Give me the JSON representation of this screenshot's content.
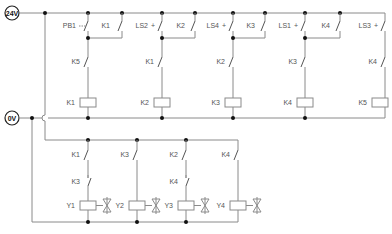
{
  "terminals": {
    "supply": {
      "label": "24V",
      "x": 12,
      "y": 13
    },
    "ground": {
      "label": "0V",
      "x": 12,
      "y": 118
    }
  },
  "colors": {
    "wire": "#8a8a8a",
    "node": "#111111",
    "text": "#555555"
  },
  "control_rungs": [
    {
      "id": "rung1",
      "input": {
        "label": "PB1",
        "type": "pushbutton-no"
      },
      "holding": {
        "label": "K1"
      },
      "interlock": {
        "label": "K5",
        "type": "no"
      },
      "coil": {
        "label": "K1"
      }
    },
    {
      "id": "rung2",
      "input": {
        "label": "LS2",
        "type": "limit-switch-no"
      },
      "holding": {
        "label": "K2"
      },
      "interlock": {
        "label": "K1",
        "type": "no"
      },
      "coil": {
        "label": "K2"
      }
    },
    {
      "id": "rung3",
      "input": {
        "label": "LS4",
        "type": "limit-switch-no"
      },
      "holding": {
        "label": "K3"
      },
      "interlock": {
        "label": "K2",
        "type": "no"
      },
      "coil": {
        "label": "K3"
      }
    },
    {
      "id": "rung4",
      "input": {
        "label": "LS1",
        "type": "limit-switch-no"
      },
      "holding": {
        "label": "K4"
      },
      "interlock": {
        "label": "K3",
        "type": "no"
      },
      "coil": {
        "label": "K4"
      }
    },
    {
      "id": "rung5",
      "input": {
        "label": "LS3",
        "type": "limit-switch-no"
      },
      "holding": null,
      "interlock": {
        "label": "K4",
        "type": "no"
      },
      "coil": {
        "label": "K5"
      }
    }
  ],
  "output_rungs": [
    {
      "id": "out1",
      "contact1": {
        "label": "K1",
        "type": "no"
      },
      "contact2": {
        "label": "K3",
        "type": "nc"
      },
      "solenoid": {
        "label": "Y1"
      }
    },
    {
      "id": "out2",
      "contact1": {
        "label": "K3",
        "type": "no"
      },
      "contact2": null,
      "solenoid": {
        "label": "Y2"
      }
    },
    {
      "id": "out3",
      "contact1": {
        "label": "K2",
        "type": "no"
      },
      "contact2": {
        "label": "K4",
        "type": "nc"
      },
      "solenoid": {
        "label": "Y3"
      }
    },
    {
      "id": "out4",
      "contact1": {
        "label": "K4",
        "type": "no"
      },
      "contact2": null,
      "solenoid": {
        "label": "Y4"
      }
    }
  ]
}
